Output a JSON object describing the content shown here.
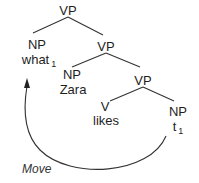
{
  "diagram": {
    "type": "syntax-tree",
    "nodes": {
      "vp_root": {
        "label": "VP"
      },
      "np_what": {
        "label": "NP",
        "word": "what",
        "index": "1"
      },
      "vp_mid": {
        "label": "VP"
      },
      "np_zara": {
        "label": "NP",
        "word": "Zara"
      },
      "vp_low": {
        "label": "VP"
      },
      "v_likes": {
        "label": "V",
        "word": "likes"
      },
      "np_trace": {
        "label": "NP",
        "word": "t",
        "index": "1"
      }
    },
    "edges": [
      [
        "vp_root",
        "np_what"
      ],
      [
        "vp_root",
        "vp_mid"
      ],
      [
        "vp_mid",
        "np_zara"
      ],
      [
        "vp_mid",
        "vp_low"
      ],
      [
        "vp_low",
        "v_likes"
      ],
      [
        "vp_low",
        "np_trace"
      ]
    ],
    "movement": {
      "from": "np_trace",
      "to": "np_what",
      "label": "Move"
    },
    "colors": {
      "line": "#333333",
      "text": "#1e1e1e"
    }
  }
}
